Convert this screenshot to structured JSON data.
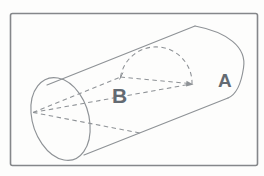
{
  "figure": {
    "type": "cylinder-cross-section-line-drawing",
    "labels": {
      "a": "A",
      "b": "B"
    }
  },
  "colors": {
    "background": "#fdfdfc",
    "frame": "#85878a",
    "line": "#8e9296",
    "label": "#636a72"
  }
}
